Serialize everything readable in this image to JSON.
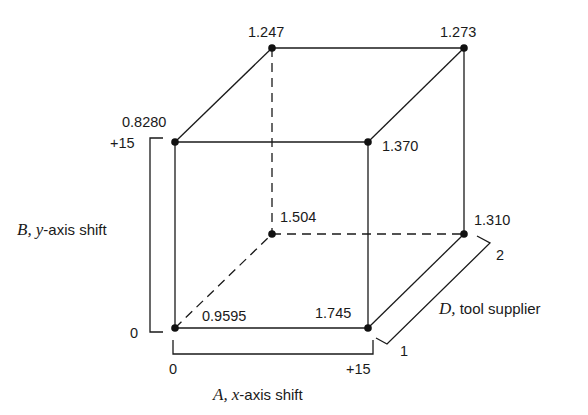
{
  "diagram": {
    "type": "cube-design-plot",
    "vertices": {
      "front_bottom_left": {
        "A": "0",
        "B": "0",
        "D": "1",
        "value": "0.9595"
      },
      "front_bottom_right": {
        "A": "+15",
        "B": "0",
        "D": "1",
        "value": "1.745"
      },
      "front_top_left": {
        "A": "0",
        "B": "+15",
        "D": "1",
        "value": "0.8280"
      },
      "front_top_right": {
        "A": "+15",
        "B": "+15",
        "D": "1",
        "value": "1.370"
      },
      "back_bottom_left": {
        "A": "0",
        "B": "0",
        "D": "2",
        "value": "1.504"
      },
      "back_bottom_right": {
        "A": "+15",
        "B": "0",
        "D": "2",
        "value": "1.310"
      },
      "back_top_left": {
        "A": "0",
        "B": "+15",
        "D": "2",
        "value": "1.247"
      },
      "back_top_right": {
        "A": "+15",
        "B": "+15",
        "D": "2",
        "value": "1.273"
      }
    },
    "axes": {
      "A": {
        "letter": "A,",
        "label": "x",
        "suffix": "-axis shift",
        "low": "0",
        "high": "+15"
      },
      "B": {
        "letter": "B,",
        "label": "y",
        "suffix": "-axis shift",
        "low": "0",
        "high": "+15"
      },
      "D": {
        "letter": "D,",
        "label": "",
        "suffix": " tool supplier",
        "low": "1",
        "high": "2"
      }
    }
  }
}
